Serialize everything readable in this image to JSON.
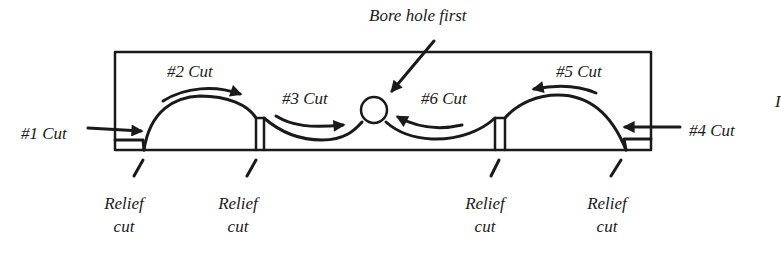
{
  "diagram": {
    "colors": {
      "ink": "#1a1a1a",
      "background": "#ffffff"
    },
    "labels": {
      "bore": "Bore hole first",
      "cut1": "#1 Cut",
      "cut2": "#2 Cut",
      "cut3": "#3 Cut",
      "cut4": "#4 Cut",
      "cut5": "#5 Cut",
      "cut6": "#6 Cut",
      "cropped_edge_char": "I"
    },
    "relief_cuts": [
      {
        "line1": "Relief",
        "line2": "cut"
      },
      {
        "line1": "Relief",
        "line2": "cut"
      },
      {
        "line1": "Relief",
        "line2": "cut"
      },
      {
        "line1": "Relief",
        "line2": "cut"
      }
    ]
  }
}
